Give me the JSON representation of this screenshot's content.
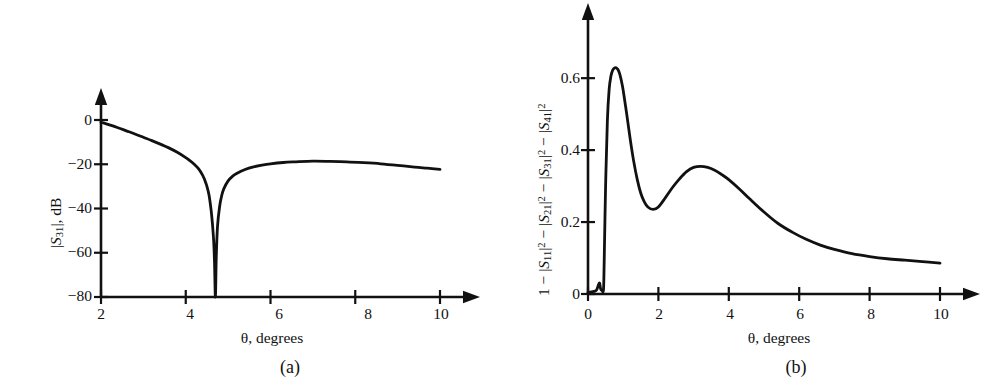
{
  "figure": {
    "background": "#ffffff",
    "line_color": "#111111"
  },
  "panel_a": {
    "caption": "(a)",
    "xlabel": "θ, degrees",
    "ylabel_parts": {
      "bar1": "|",
      "s": "S",
      "subscript": "31",
      "bar2": "|",
      "unit": ", dB"
    },
    "ylabel_plain": "|S31|, dB",
    "xticks": [
      "2",
      "4",
      "6",
      "8",
      "10"
    ],
    "yticks": [
      "0",
      "−20",
      "−40",
      "−60",
      "−80"
    ]
  },
  "panel_b": {
    "caption": "(b)",
    "xlabel": "θ, degrees",
    "ylabel_plain": "1 − |S11|² − |S21|² − |S31|² − |S41|²",
    "xticks": [
      "0",
      "2",
      "4",
      "6",
      "8",
      "10"
    ],
    "yticks": [
      "0",
      "0.2",
      "0.4",
      "0.6"
    ]
  },
  "chart_data": [
    {
      "type": "line",
      "panel": "(a)",
      "title": "",
      "xlabel": "θ, degrees",
      "ylabel": "|S31|, dB",
      "xlim": [
        2,
        10
      ],
      "ylim": [
        -80,
        0
      ],
      "xticks": [
        2,
        4,
        6,
        8,
        10
      ],
      "yticks": [
        0,
        -20,
        -40,
        -60,
        -80
      ],
      "grid": false,
      "legend": "none",
      "series": [
        {
          "name": "|S31|",
          "x": [
            2.0,
            2.2,
            2.4,
            2.6,
            2.8,
            3.0,
            3.2,
            3.4,
            3.6,
            3.8,
            4.0,
            4.1,
            4.2,
            4.3,
            4.4,
            4.45,
            4.5,
            4.55,
            4.6,
            4.63,
            4.66,
            4.68,
            4.7,
            4.72,
            4.75,
            4.8,
            4.85,
            4.9,
            5.0,
            5.1,
            5.2,
            5.4,
            5.6,
            5.8,
            6.0,
            6.3,
            6.6,
            7.0,
            7.4,
            7.8,
            8.2,
            8.6,
            9.0,
            9.4,
            9.7,
            10.0
          ],
          "y": [
            -1.0,
            -2.2,
            -3.5,
            -4.9,
            -6.3,
            -7.8,
            -9.3,
            -10.9,
            -12.6,
            -14.6,
            -17.0,
            -18.4,
            -20.0,
            -22.0,
            -25.0,
            -27.2,
            -30.0,
            -34.0,
            -41.0,
            -47.0,
            -55.0,
            -65.0,
            -80.0,
            -62.0,
            -48.0,
            -39.0,
            -34.0,
            -31.0,
            -27.5,
            -25.5,
            -24.2,
            -22.4,
            -21.2,
            -20.4,
            -19.8,
            -19.2,
            -18.9,
            -18.6,
            -18.7,
            -18.9,
            -19.3,
            -19.8,
            -20.5,
            -21.3,
            -21.8,
            -22.3
          ]
        }
      ]
    },
    {
      "type": "line",
      "panel": "(b)",
      "title": "",
      "xlabel": "θ, degrees",
      "ylabel": "1 − |S11|² − |S21|² − |S31|² − |S41|²",
      "xlim": [
        0,
        10
      ],
      "ylim": [
        0,
        0.72
      ],
      "xticks": [
        0,
        2,
        4,
        6,
        8,
        10
      ],
      "yticks": [
        0,
        0.2,
        0.4,
        0.6
      ],
      "grid": false,
      "legend": "none",
      "series": [
        {
          "name": "absorbed power fraction",
          "x": [
            0.0,
            0.1,
            0.2,
            0.25,
            0.3,
            0.33,
            0.36,
            0.4,
            0.44,
            0.46,
            0.5,
            0.55,
            0.6,
            0.65,
            0.7,
            0.75,
            0.8,
            0.85,
            0.9,
            0.95,
            1.0,
            1.1,
            1.2,
            1.3,
            1.4,
            1.5,
            1.6,
            1.7,
            1.85,
            2.0,
            2.2,
            2.4,
            2.6,
            2.8,
            3.0,
            3.2,
            3.4,
            3.6,
            3.8,
            4.0,
            4.3,
            4.6,
            5.0,
            5.4,
            5.8,
            6.2,
            6.6,
            7.0,
            7.5,
            8.0,
            8.5,
            9.0,
            9.5,
            10.0
          ],
          "y": [
            0.004,
            0.006,
            0.008,
            0.012,
            0.026,
            0.03,
            0.014,
            0.01,
            0.012,
            0.09,
            0.3,
            0.48,
            0.568,
            0.605,
            0.622,
            0.628,
            0.629,
            0.624,
            0.612,
            0.592,
            0.566,
            0.5,
            0.43,
            0.368,
            0.318,
            0.28,
            0.256,
            0.242,
            0.235,
            0.242,
            0.268,
            0.296,
            0.32,
            0.34,
            0.352,
            0.355,
            0.352,
            0.344,
            0.332,
            0.318,
            0.292,
            0.264,
            0.228,
            0.196,
            0.172,
            0.152,
            0.136,
            0.124,
            0.112,
            0.104,
            0.098,
            0.094,
            0.09,
            0.086
          ]
        }
      ]
    }
  ]
}
